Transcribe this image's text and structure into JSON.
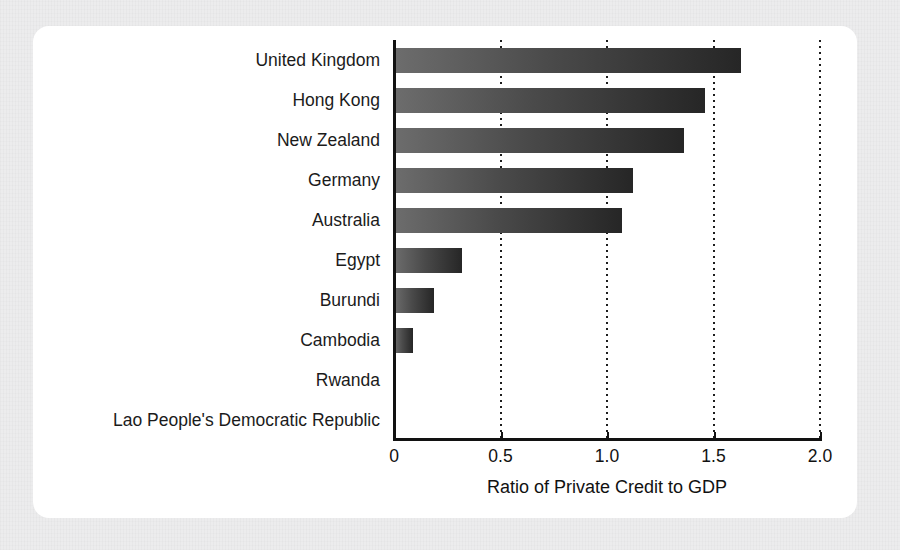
{
  "chart_data": {
    "type": "bar",
    "orientation": "horizontal",
    "title": "",
    "xlabel": "Ratio of Private Credit to GDP",
    "ylabel": "",
    "xlim": [
      0,
      2.0
    ],
    "xticks": [
      "0",
      "0.5",
      "1.0",
      "1.5",
      "2.0"
    ],
    "xtick_values": [
      0,
      0.5,
      1.0,
      1.5,
      2.0
    ],
    "grid": "vertical dotted gridlines at 0.5, 1.0, 1.5, 2.0",
    "legend": "none",
    "categories": [
      "United Kingdom",
      "Hong Kong",
      "New Zealand",
      "Germany",
      "Australia",
      "Egypt",
      "Burundi",
      "Cambodia",
      "Rwanda",
      "Lao People's Democratic Republic"
    ],
    "values": [
      1.63,
      1.46,
      1.36,
      1.12,
      1.07,
      0.32,
      0.19,
      0.09,
      0.0,
      0.0
    ],
    "bar_gradient_start": "#6d6d6d",
    "bar_gradient_end": "#262626",
    "axis_color": "#121212",
    "panel_color": "#ffffff",
    "page_background": "#ececed"
  }
}
